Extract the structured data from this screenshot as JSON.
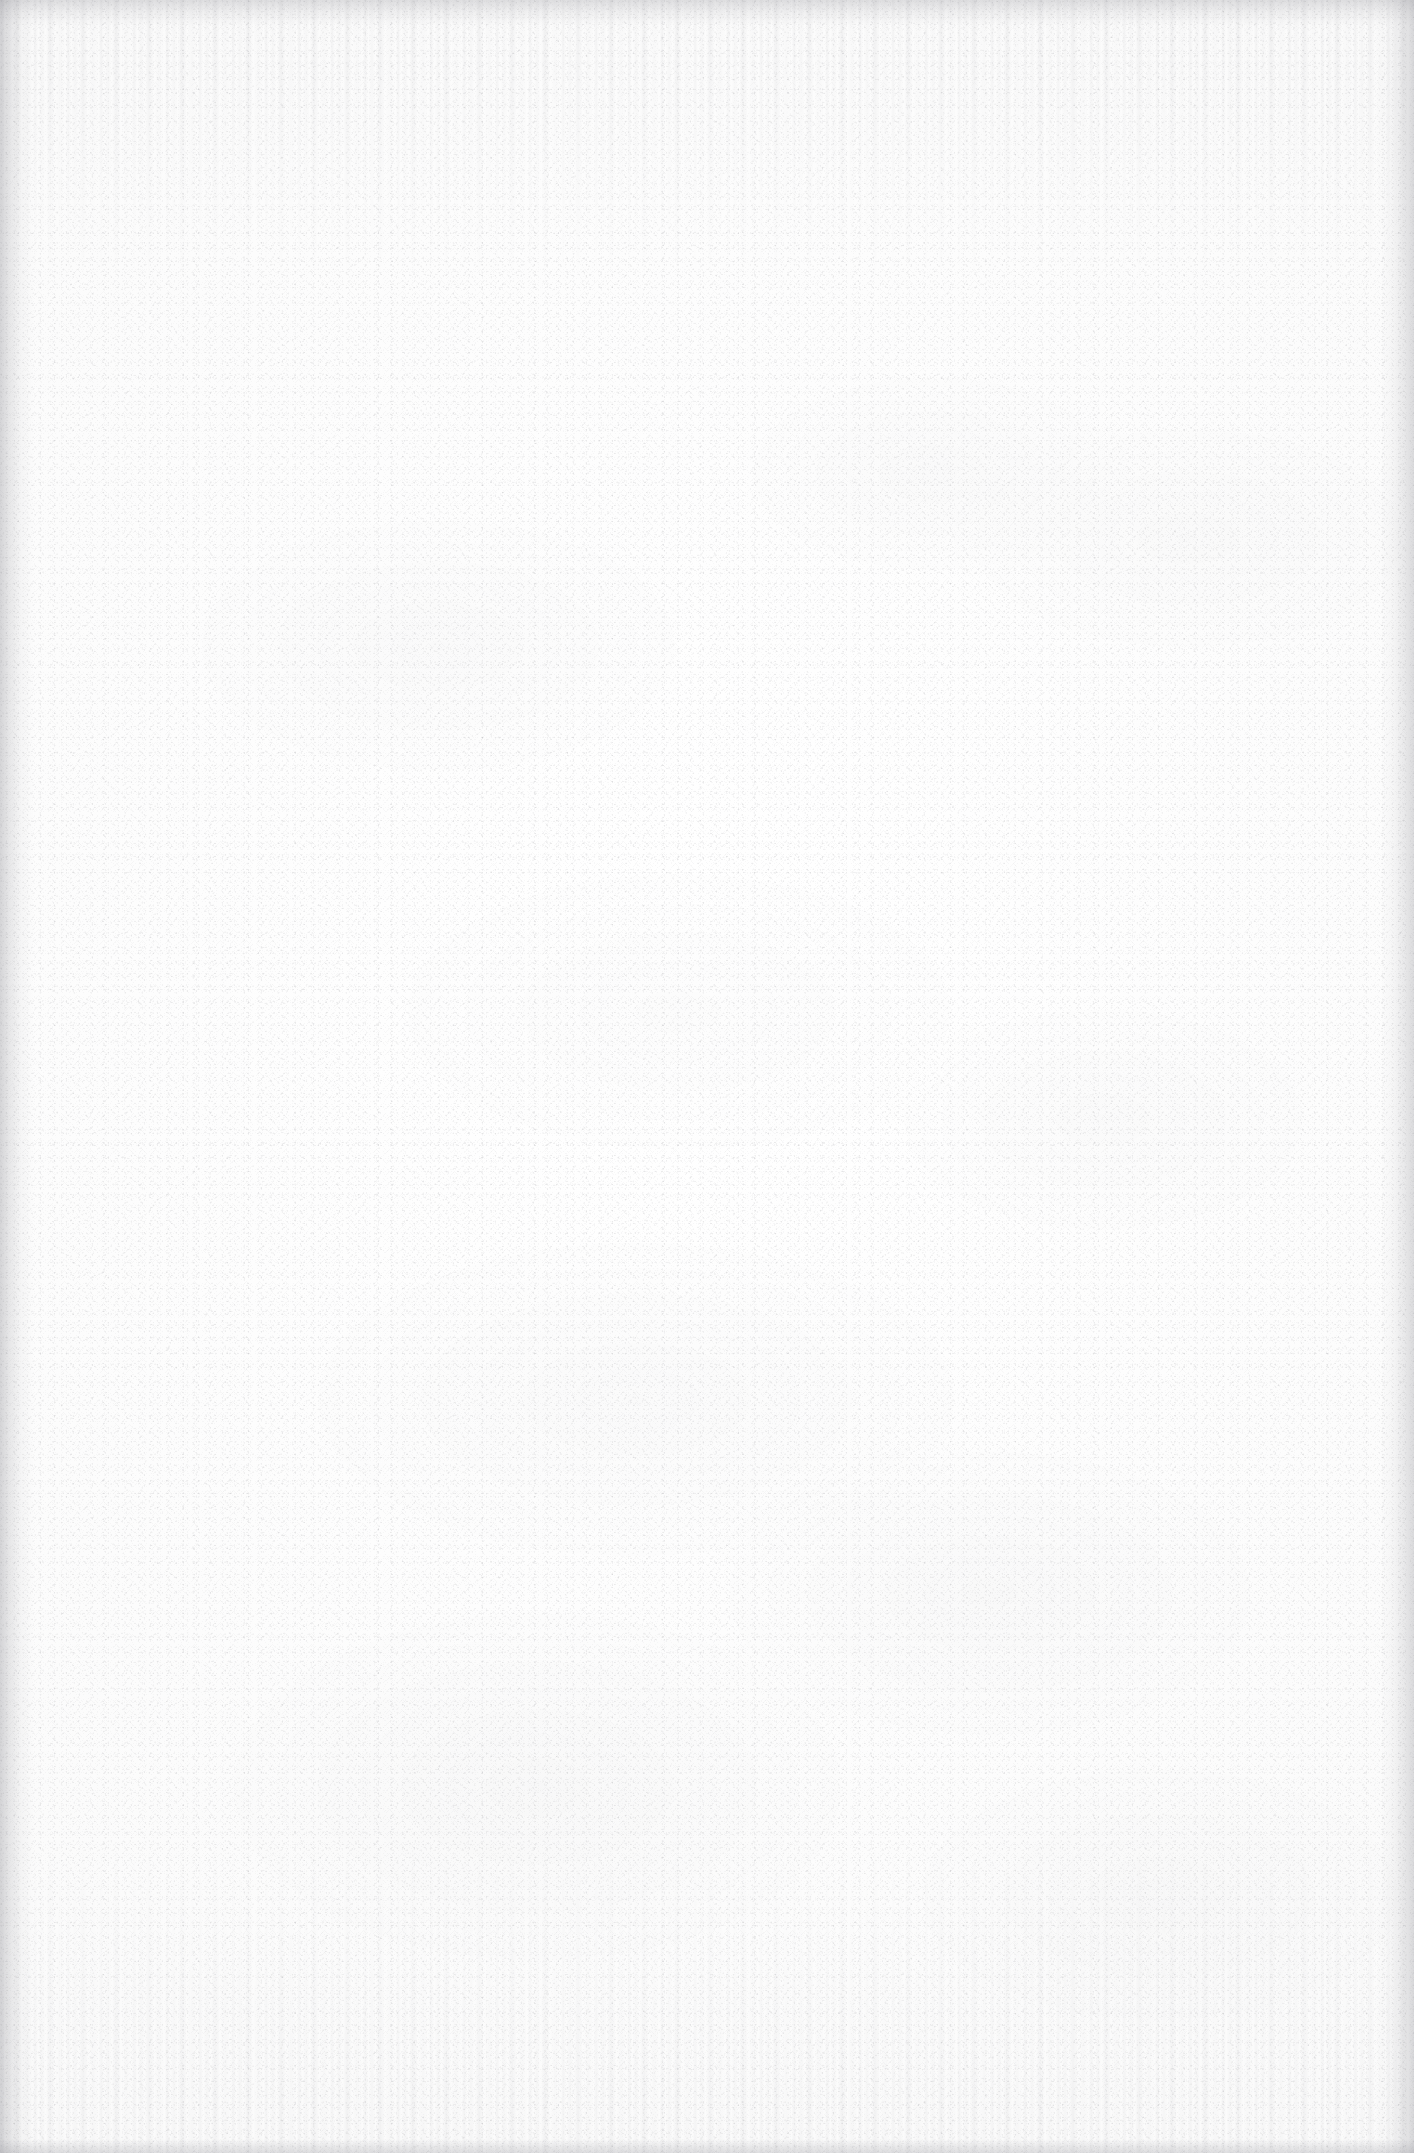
{
  "page": {
    "kind": "scanned-blank-page",
    "width": 1414,
    "height": 2153,
    "visible_text": "",
    "content_description": "Blank scanned page: no text, headings, figures, tables or UI controls are rendered anywhere on the page.",
    "accessible_summary": "Blank scanned page"
  },
  "appearance": {
    "paper_color": "#fdfdfd",
    "paper_center_color": "#ffffff",
    "paper_edge_color": "#fbfbfb",
    "grain_color": "#787880",
    "mottle_color": "#73737a",
    "edge_shadow_color": "#787880",
    "bottom_strip_color": "#e8e8ea"
  },
  "artifacts": {
    "left_edge_shadow": true,
    "right_edge_shadow": true,
    "top_edge_shadow": true,
    "bottom_edge_strip": true,
    "vertical_streaks_top": true,
    "vertical_streaks_bottom": true,
    "speckle_grain": true,
    "diffuse_mottling": true
  }
}
